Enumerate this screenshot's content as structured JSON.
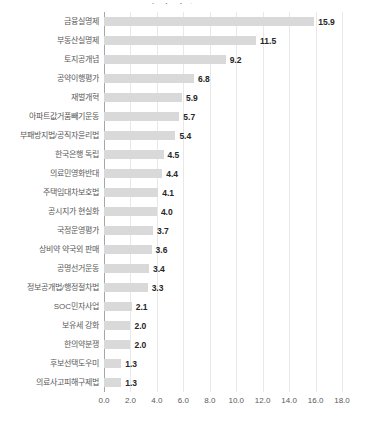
{
  "chart_data": {
    "type": "bar",
    "orientation": "horizontal",
    "title_clipped": "성과지수",
    "categories": [
      "금융실명제",
      "부동산실명제",
      "토지공개념",
      "공약이행평가",
      "재벌개혁",
      "아파트값거품빼기운동",
      "부패방지법/공직자윤리법",
      "한국은행 독립",
      "의료민영화반대",
      "주택임대차보호법",
      "공시지가 현실화",
      "국정운영평가",
      "상비약 약국외 판매",
      "공명선거운동",
      "정보공개법/행정절차법",
      "SOC민자사업",
      "보유세 강화",
      "한의약분쟁",
      "후보선택도우미",
      "의료사고피해구제법"
    ],
    "values": [
      15.9,
      11.5,
      9.2,
      6.8,
      5.9,
      5.7,
      5.4,
      4.5,
      4.4,
      4.1,
      4.0,
      3.7,
      3.6,
      3.4,
      3.3,
      2.1,
      2.0,
      2.0,
      1.3,
      1.3
    ],
    "value_labels": [
      "15.9",
      "11.5",
      "9.2",
      "6.8",
      "5.9",
      "5.7",
      "5.4",
      "4.5",
      "4.4",
      "4.1",
      "4.0",
      "3.7",
      "3.6",
      "3.4",
      "3.3",
      "2.1",
      "2.0",
      "2.0",
      "1.3",
      "1.3"
    ],
    "xlabel": "",
    "ylabel": "",
    "xlim": [
      0,
      18
    ],
    "x_ticks": [
      "0.0",
      "2.0",
      "4.0",
      "6.0",
      "8.0",
      "10.0",
      "12.0",
      "14.0",
      "16.0",
      "18.0"
    ],
    "x_tick_values": [
      0,
      2,
      4,
      6,
      8,
      10,
      12,
      14,
      16,
      18
    ],
    "grid": true,
    "legend": "none",
    "colors": {
      "bar": "#d9d9d9",
      "gridline": "#e8e8e8",
      "axis_line": "#a6a6a6",
      "category_label": "#595959",
      "value_label": "#262626",
      "tick_label": "#595959",
      "background": "#ffffff"
    }
  }
}
